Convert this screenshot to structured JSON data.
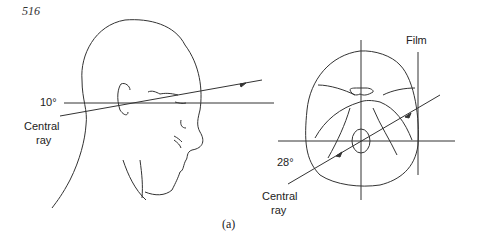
{
  "page_number": "516",
  "left_figure": {
    "angle_label": "10°",
    "ray_label_line1": "Central",
    "ray_label_line2": "ray"
  },
  "right_figure": {
    "film_label": "Film",
    "angle_label": "28°",
    "ray_label_line1": "Central",
    "ray_label_line2": "ray"
  },
  "caption": "(a)"
}
